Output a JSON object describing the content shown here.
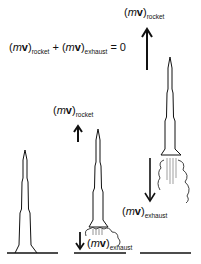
{
  "diagram": {
    "equation": {
      "m": "m",
      "v": "v",
      "sub_rocket": "rocket",
      "plus": "+",
      "sub_exhaust": "exhaust",
      "equals": "= 0"
    },
    "stages": [
      {
        "name": "at-rest",
        "labels": []
      },
      {
        "name": "liftoff",
        "labels": [
          {
            "m": "m",
            "v": "v",
            "sub": "rocket",
            "arrow": "up"
          },
          {
            "m": "m",
            "v": "v",
            "sub": "exhaust",
            "arrow": "down"
          }
        ]
      },
      {
        "name": "in-flight",
        "labels": [
          {
            "m": "m",
            "v": "v",
            "sub": "rocket",
            "arrow": "up"
          },
          {
            "m": "m",
            "v": "v",
            "sub": "exhaust",
            "arrow": "down"
          }
        ]
      }
    ],
    "colors": {
      "ink": "#111111",
      "background": "#ffffff",
      "exhaust_lines": "#888888"
    }
  }
}
